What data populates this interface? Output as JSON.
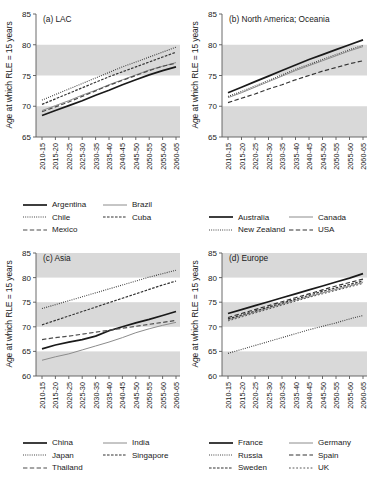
{
  "figure": {
    "ylabel": "Age at which RLE = 15 years",
    "band_color": "#d9d9d9",
    "axis_color": "#595959"
  },
  "chart_data": [
    {
      "type": "line",
      "title": "(a) LAC",
      "xlabel": "",
      "ylabel": "Age at which RLE = 15 years",
      "categories": [
        "2010-15",
        "2015-20",
        "2020-25",
        "2025-30",
        "2030-35",
        "2035-40",
        "2040-45",
        "2045-50",
        "2050-55",
        "2055-60",
        "2060-65"
      ],
      "ylim": [
        65,
        85
      ],
      "yticks": [
        65,
        70,
        75,
        80,
        85
      ],
      "grid": false,
      "shaded_bands": [
        [
          65,
          70
        ],
        [
          75,
          80
        ]
      ],
      "legend_position": "below",
      "series": [
        {
          "name": "Argentina",
          "style": "solid-thick",
          "color": "#1a1a1a",
          "values": [
            68.5,
            69.3,
            70.1,
            70.9,
            71.8,
            72.6,
            73.5,
            74.3,
            75.1,
            75.8,
            76.4
          ]
        },
        {
          "name": "Brazil",
          "style": "solid-thin",
          "color": "#8c8c8c",
          "values": [
            69.3,
            70.1,
            70.9,
            71.8,
            72.6,
            73.5,
            74.3,
            75.1,
            75.9,
            76.5,
            77.1
          ]
        },
        {
          "name": "Chile",
          "style": "dotted",
          "color": "#333333",
          "values": [
            71.0,
            71.9,
            72.8,
            73.7,
            74.6,
            75.5,
            76.4,
            77.2,
            78.0,
            78.8,
            79.6
          ]
        },
        {
          "name": "Cuba",
          "style": "dash-dot",
          "color": "#333333",
          "values": [
            70.3,
            71.2,
            72.1,
            73.0,
            73.9,
            74.8,
            75.6,
            76.4,
            77.2,
            78.0,
            78.8
          ]
        },
        {
          "name": "Mexico",
          "style": "long-dash",
          "color": "#4d4d4d",
          "values": [
            69.1,
            69.9,
            70.7,
            71.6,
            72.5,
            73.4,
            74.2,
            75.0,
            75.8,
            76.5,
            77.0
          ]
        }
      ]
    },
    {
      "type": "line",
      "title": "(b) North America; Oceania",
      "xlabel": "",
      "ylabel": "Age at which RLE = 15 years",
      "categories": [
        "2010-15",
        "2015-20",
        "2020-25",
        "2025-30",
        "2030-35",
        "2035-40",
        "2040-45",
        "2045-50",
        "2050-55",
        "2055-60",
        "2060-65"
      ],
      "ylim": [
        65,
        85
      ],
      "yticks": [
        65,
        70,
        75,
        80,
        85
      ],
      "grid": false,
      "shaded_bands": [
        [
          65,
          70
        ],
        [
          75,
          80
        ]
      ],
      "legend_position": "below",
      "series": [
        {
          "name": "Australia",
          "style": "solid-thick",
          "color": "#1a1a1a",
          "values": [
            72.2,
            73.1,
            74.0,
            74.9,
            75.8,
            76.7,
            77.6,
            78.4,
            79.2,
            80.0,
            80.8
          ]
        },
        {
          "name": "Canada",
          "style": "solid-thin",
          "color": "#8c8c8c",
          "values": [
            71.4,
            72.2,
            73.1,
            74.0,
            74.9,
            75.8,
            76.6,
            77.4,
            78.2,
            79.0,
            79.7
          ]
        },
        {
          "name": "New Zealand",
          "style": "dotted",
          "color": "#333333",
          "values": [
            71.6,
            72.4,
            73.3,
            74.2,
            75.1,
            76.0,
            76.8,
            77.6,
            78.4,
            79.2,
            79.9
          ]
        },
        {
          "name": "USA",
          "style": "long-dash",
          "color": "#333333",
          "values": [
            70.6,
            71.3,
            72.0,
            72.8,
            73.5,
            74.3,
            75.0,
            75.7,
            76.3,
            76.9,
            77.4
          ]
        }
      ]
    },
    {
      "type": "line",
      "title": "(c) Asia",
      "xlabel": "",
      "ylabel": "Age at which RLE = 15 years",
      "categories": [
        "2010-15",
        "2015-20",
        "2020-25",
        "2025-30",
        "2030-35",
        "2035-40",
        "2040-45",
        "2045-50",
        "2050-55",
        "2055-60",
        "2060-65"
      ],
      "ylim": [
        60,
        85
      ],
      "yticks": [
        60,
        65,
        70,
        75,
        80,
        85
      ],
      "grid": false,
      "shaded_bands": [
        [
          60,
          65
        ],
        [
          70,
          75
        ],
        [
          80,
          85
        ]
      ],
      "legend_position": "below",
      "series": [
        {
          "name": "China",
          "style": "solid-thick",
          "color": "#1a1a1a",
          "values": [
            65.5,
            66.3,
            66.9,
            67.4,
            68.1,
            69.2,
            70.0,
            70.8,
            71.5,
            72.3,
            73.1
          ]
        },
        {
          "name": "India",
          "style": "solid-thin",
          "color": "#8c8c8c",
          "values": [
            63.2,
            63.9,
            64.5,
            65.3,
            66.1,
            66.9,
            67.8,
            68.8,
            69.6,
            70.3,
            70.9
          ]
        },
        {
          "name": "Japan",
          "style": "dotted",
          "color": "#333333",
          "values": [
            73.7,
            74.5,
            75.3,
            76.1,
            76.9,
            77.7,
            78.5,
            79.3,
            80.1,
            80.8,
            81.5
          ]
        },
        {
          "name": "Singapore",
          "style": "dash-dot",
          "color": "#333333",
          "values": [
            70.4,
            71.3,
            72.2,
            73.1,
            74.0,
            74.9,
            75.8,
            76.7,
            77.6,
            78.5,
            79.3
          ]
        },
        {
          "name": "Thailand",
          "style": "long-dash",
          "color": "#4d4d4d",
          "values": [
            67.4,
            67.8,
            68.1,
            68.5,
            68.9,
            69.3,
            69.7,
            70.1,
            70.5,
            70.9,
            71.3
          ]
        }
      ]
    },
    {
      "type": "line",
      "title": "(d) Europe",
      "xlabel": "",
      "ylabel": "Age at which RLE = 15 years",
      "categories": [
        "2010-15",
        "2015-20",
        "2020-25",
        "2025-30",
        "2030-35",
        "2035-40",
        "2040-45",
        "2045-50",
        "2050-55",
        "2055-60",
        "2060-65"
      ],
      "ylim": [
        60,
        85
      ],
      "yticks": [
        60,
        65,
        70,
        75,
        80,
        85
      ],
      "grid": false,
      "shaded_bands": [
        [
          60,
          65
        ],
        [
          70,
          75
        ],
        [
          80,
          85
        ]
      ],
      "legend_position": "below",
      "series": [
        {
          "name": "France",
          "style": "solid-thick",
          "color": "#1a1a1a",
          "values": [
            72.7,
            73.5,
            74.3,
            75.1,
            75.9,
            76.7,
            77.5,
            78.3,
            79.1,
            79.9,
            80.8
          ]
        },
        {
          "name": "Germany",
          "style": "solid-thin",
          "color": "#8c8c8c",
          "values": [
            71.4,
            72.2,
            73.0,
            73.8,
            74.6,
            75.4,
            76.1,
            76.9,
            77.6,
            78.3,
            79.0
          ]
        },
        {
          "name": "Russia",
          "style": "dotted",
          "color": "#333333",
          "values": [
            64.6,
            65.4,
            66.2,
            67.0,
            67.8,
            68.6,
            69.4,
            70.1,
            70.8,
            71.6,
            72.3
          ]
        },
        {
          "name": "Spain",
          "style": "long-dash",
          "color": "#333333",
          "values": [
            71.9,
            72.7,
            73.5,
            74.3,
            75.1,
            75.9,
            76.7,
            77.5,
            78.3,
            79.0,
            79.7
          ]
        },
        {
          "name": "Sweden",
          "style": "dash-dot",
          "color": "#333333",
          "values": [
            71.6,
            72.4,
            73.2,
            74.0,
            74.8,
            75.6,
            76.4,
            77.2,
            77.9,
            78.6,
            79.3
          ]
        },
        {
          "name": "UK",
          "style": "short-dash",
          "color": "#595959",
          "values": [
            71.2,
            72.0,
            72.8,
            73.6,
            74.4,
            75.2,
            76.0,
            76.7,
            77.4,
            78.1,
            78.8
          ]
        }
      ]
    }
  ],
  "legends": [
    {
      "rows": [
        [
          "Argentina",
          "Brazil"
        ],
        [
          "Chile",
          "Cuba"
        ],
        [
          "Mexico",
          null
        ]
      ]
    },
    {
      "rows": [
        [
          "Australia",
          "Canada"
        ],
        [
          "New Zealand",
          "USA"
        ]
      ]
    },
    {
      "rows": [
        [
          "China",
          "India"
        ],
        [
          "Japan",
          "Singapore"
        ],
        [
          "Thailand",
          null
        ]
      ]
    },
    {
      "rows": [
        [
          "France",
          "Germany"
        ],
        [
          "Russia",
          "Spain"
        ],
        [
          "Sweden",
          "UK"
        ]
      ]
    }
  ]
}
